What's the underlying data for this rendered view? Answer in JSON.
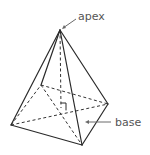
{
  "diagram": {
    "title": "",
    "labels": {
      "apex": "apex",
      "base": "base"
    },
    "shape": "square pyramid",
    "colors": {
      "edge": "#2a2a2a",
      "label": "#555555",
      "pointer": "#6a6a6a",
      "background": "#ffffff"
    }
  }
}
